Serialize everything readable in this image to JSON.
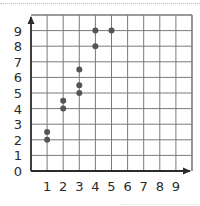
{
  "chart_data": {
    "type": "scatter",
    "title": "",
    "xlabel": "",
    "ylabel": "",
    "xlim": [
      0,
      10
    ],
    "ylim": [
      0,
      10
    ],
    "grid": true,
    "x_ticks": [
      "1",
      "2",
      "3",
      "4",
      "5",
      "6",
      "7",
      "8",
      "9"
    ],
    "y_ticks": [
      "0",
      "1",
      "2",
      "3",
      "4",
      "5",
      "6",
      "7",
      "8",
      "9"
    ],
    "points": [
      {
        "x": 1,
        "y": 2
      },
      {
        "x": 1,
        "y": 2.5
      },
      {
        "x": 2,
        "y": 4
      },
      {
        "x": 2,
        "y": 4.5
      },
      {
        "x": 3,
        "y": 5
      },
      {
        "x": 3,
        "y": 5.5
      },
      {
        "x": 3,
        "y": 6.5
      },
      {
        "x": 4,
        "y": 8
      },
      {
        "x": 4,
        "y": 9
      },
      {
        "x": 5,
        "y": 9
      }
    ],
    "colors": {
      "point": "#555555",
      "grid": "#7a7a7a",
      "axis": "#2b2b2b",
      "label": "#2b2b2b"
    }
  }
}
